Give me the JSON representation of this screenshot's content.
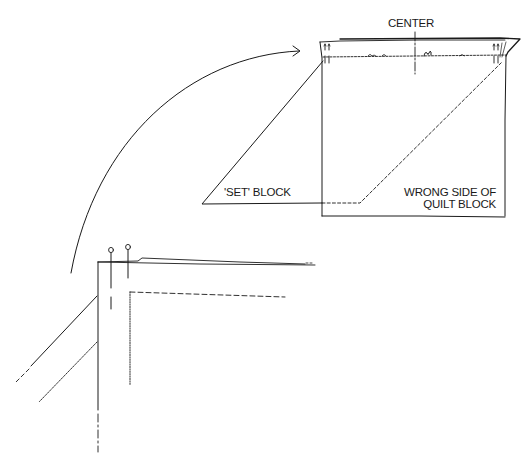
{
  "diagram": {
    "type": "quilting-instruction-illustration",
    "ink_color": "#1a1a1a",
    "background": "#ffffff",
    "labels": {
      "center": "CENTER",
      "set_block": "'SET' BLOCK",
      "quilt_block_line1": "WRONG SIDE OF",
      "quilt_block_line2": "QUILT BLOCK"
    },
    "elements": [
      {
        "name": "quilt-block",
        "description": "Square quilt block shown wrong side up with gathered top edge and pins"
      },
      {
        "name": "set-block",
        "description": "Triangular 'set' block overlapping quilt block, hidden edge dashed"
      },
      {
        "name": "center-mark",
        "description": "Vertical center line marking on the top edge"
      },
      {
        "name": "curved-arrow",
        "description": "Arrow from enlarged corner detail to the block corner"
      },
      {
        "name": "corner-detail",
        "description": "Enlarged corner with two pins, seam line dashed, edges dotted"
      }
    ]
  }
}
